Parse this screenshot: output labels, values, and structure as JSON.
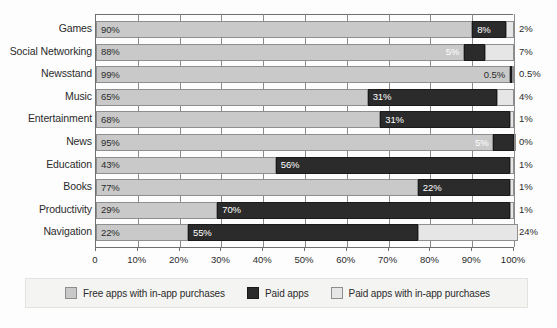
{
  "chart_data": {
    "type": "bar",
    "subtype": "horizontal-stacked-100",
    "title": "",
    "xlabel": "",
    "ylabel": "",
    "xlim": [
      0,
      100
    ],
    "grid": true,
    "legend_position": "bottom",
    "categories": [
      "Games",
      "Social Networking",
      "Newsstand",
      "Music",
      "Entertainment",
      "News",
      "Education",
      "Books",
      "Productivity",
      "Navigation"
    ],
    "series": [
      {
        "name": "Free apps with in-app purchases",
        "color": "#c9c9c9",
        "values": [
          90,
          88,
          99,
          65,
          68,
          95,
          43,
          77,
          29,
          22
        ],
        "labels": [
          "90%",
          "88%",
          "99%",
          "65%",
          "68%",
          "95%",
          "43%",
          "77%",
          "29%",
          "22%"
        ]
      },
      {
        "name": "Paid apps",
        "color": "#2b2b2b",
        "values": [
          8,
          5,
          0.5,
          31,
          31,
          5,
          56,
          22,
          70,
          55
        ],
        "labels": [
          "8%",
          "5%",
          "0.5%",
          "31%",
          "31%",
          "5%",
          "56%",
          "22%",
          "70%",
          "55%"
        ]
      },
      {
        "name": "Paid apps with in-app purchases",
        "color": "#e6e6e6",
        "values": [
          2,
          7,
          0.5,
          4,
          1,
          0,
          1,
          1,
          1,
          24
        ],
        "labels": [
          "2%",
          "7%",
          "0.5%",
          "4%",
          "1%",
          "0%",
          "1%",
          "1%",
          "1%",
          "24%"
        ]
      }
    ],
    "xticks": [
      0,
      10,
      20,
      30,
      40,
      50,
      60,
      70,
      80,
      90,
      100
    ],
    "xticklabels": [
      "0",
      "10%",
      "20%",
      "30%",
      "40%",
      "50%",
      "60%",
      "70%",
      "80%",
      "90%",
      "100%"
    ]
  },
  "legend": {
    "items": [
      {
        "label": "Free apps with in-app purchases",
        "swatch": "swatch-free"
      },
      {
        "label": "Paid apps",
        "swatch": "swatch-paid"
      },
      {
        "label": "Paid apps with in-app purchases",
        "swatch": "swatch-paid-iap"
      }
    ]
  }
}
